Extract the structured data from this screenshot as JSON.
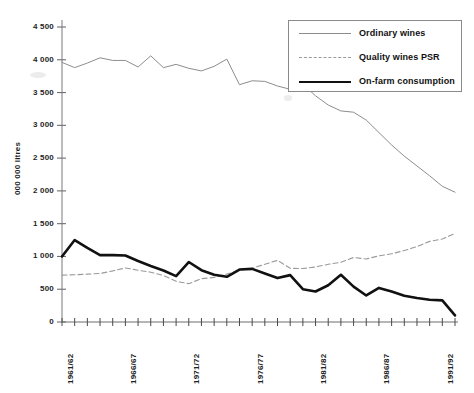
{
  "chart_data": {
    "type": "line",
    "title": "",
    "xlabel": "",
    "ylabel": "000 000 litres",
    "ylim": [
      0,
      4500
    ],
    "ytick_labels": [
      "0",
      "500",
      "1 000",
      "1 500",
      "2 000",
      "2 500",
      "3 000",
      "3 500",
      "4 000",
      "4 500"
    ],
    "ytick_values": [
      0,
      500,
      1000,
      1500,
      2000,
      2500,
      3000,
      3500,
      4000,
      4500
    ],
    "grid": false,
    "legend_position": "top-right",
    "x": [
      "1961/62",
      "1962/63",
      "1963/64",
      "1964/65",
      "1965/66",
      "1966/67",
      "1967/68",
      "1968/69",
      "1969/70",
      "1970/71",
      "1971/72",
      "1972/73",
      "1973/74",
      "1974/75",
      "1975/76",
      "1976/77",
      "1977/78",
      "1978/79",
      "1979/80",
      "1980/81",
      "1981/82",
      "1982/83",
      "1983/84",
      "1984/85",
      "1985/86",
      "1986/87",
      "1987/88",
      "1988/89",
      "1989/90",
      "1990/91",
      "1991/92",
      "1992/93"
    ],
    "xtick_labels_shown": [
      "1961/62",
      "1966/67",
      "1971/72",
      "1976/77",
      "1981/82",
      "1986/87",
      "1991/92"
    ],
    "xtick_label_indices": [
      0,
      5,
      10,
      15,
      20,
      25,
      30
    ],
    "series": [
      {
        "name": "Ordinary wines",
        "style": "solid-thin",
        "color": "#8d8d8d",
        "values": [
          3960,
          3880,
          3950,
          4030,
          3990,
          3990,
          3890,
          4060,
          3880,
          3930,
          3870,
          3830,
          3900,
          4010,
          3620,
          3680,
          3670,
          3600,
          3550,
          3630,
          3450,
          3310,
          3220,
          3200,
          3080,
          2890,
          2700,
          2530,
          2380,
          2230,
          2070,
          1980
        ]
      },
      {
        "name": "Quality wines PSR",
        "style": "dashed",
        "color": "#9a9a9a",
        "values": [
          715,
          720,
          730,
          740,
          780,
          825,
          790,
          760,
          710,
          620,
          585,
          660,
          680,
          730,
          790,
          820,
          880,
          940,
          820,
          815,
          840,
          880,
          910,
          985,
          960,
          1010,
          1040,
          1090,
          1150,
          1230,
          1265,
          1350
        ]
      },
      {
        "name": "On-farm consumption",
        "style": "solid-thick",
        "color": "#111111",
        "values": [
          1000,
          1250,
          1130,
          1020,
          1020,
          1015,
          930,
          855,
          785,
          700,
          915,
          790,
          720,
          690,
          800,
          810,
          740,
          670,
          715,
          500,
          465,
          560,
          720,
          540,
          405,
          520,
          465,
          400,
          365,
          340,
          330,
          100
        ]
      }
    ]
  },
  "legend": {
    "items": [
      {
        "label": "Ordinary wines",
        "icon": "thin-line-icon"
      },
      {
        "label": "Quality wines PSR",
        "icon": "dashed-line-icon"
      },
      {
        "label": "On-farm consumption",
        "icon": "thick-line-icon"
      }
    ]
  }
}
